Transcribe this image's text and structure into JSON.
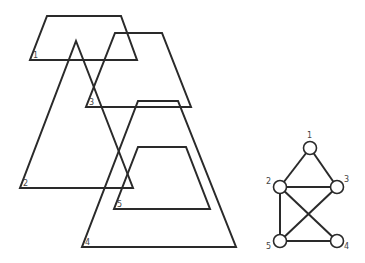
{
  "diagram": {
    "shapes": [
      {
        "id": "1",
        "type": "trapezoid",
        "points": "47,16 121,16 137,60 30,60",
        "label": "1",
        "label_pos": [
          33,
          58
        ]
      },
      {
        "id": "2",
        "type": "triangle",
        "points": "76,41 133,188 20,188",
        "label": "2",
        "label_pos": [
          23,
          186
        ]
      },
      {
        "id": "3",
        "type": "trapezoid",
        "points": "115,33 162,33 191,107 86,107",
        "label": "3",
        "label_pos": [
          89,
          105
        ]
      },
      {
        "id": "4",
        "type": "trapezoid",
        "points": "138,101 178,101 236,247 82,247",
        "label": "4",
        "label_pos": [
          85,
          245
        ]
      },
      {
        "id": "5",
        "type": "trapezoid",
        "points": "138,147 186,147 210,209 114,209",
        "label": "5",
        "label_pos": [
          117,
          207
        ]
      }
    ],
    "graph": {
      "nodes": [
        {
          "id": "1",
          "x": 310,
          "y": 148,
          "label": "1",
          "lx": 307,
          "ly": 138
        },
        {
          "id": "2",
          "x": 280,
          "y": 187,
          "label": "2",
          "lx": 266,
          "ly": 184
        },
        {
          "id": "3",
          "x": 337,
          "y": 187,
          "label": "3",
          "lx": 344,
          "ly": 182
        },
        {
          "id": "4",
          "x": 337,
          "y": 241,
          "label": "4",
          "lx": 344,
          "ly": 249
        },
        {
          "id": "5",
          "x": 280,
          "y": 241,
          "label": "5",
          "lx": 266,
          "ly": 249
        }
      ],
      "edges": [
        [
          "1",
          "2"
        ],
        [
          "1",
          "3"
        ],
        [
          "2",
          "3"
        ],
        [
          "2",
          "5"
        ],
        [
          "2",
          "4"
        ],
        [
          "3",
          "5"
        ],
        [
          "5",
          "4"
        ]
      ]
    }
  }
}
